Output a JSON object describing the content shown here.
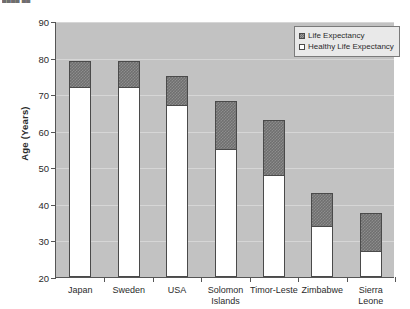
{
  "caption_sliver": "████ ██",
  "chart_data": {
    "type": "bar",
    "subtype": "stacked-overlay",
    "title": "",
    "xlabel": "",
    "ylabel": "Age (Years)",
    "ylim": [
      20,
      90
    ],
    "ytick_step": 10,
    "yticks": [
      20,
      30,
      40,
      50,
      60,
      70,
      80,
      90
    ],
    "ytick_labels": [
      "20",
      "30",
      "40",
      "50",
      "60",
      "70",
      "80",
      "90"
    ],
    "grid": true,
    "grid_axis": "y",
    "legend_position": "top-right",
    "plot_background": "#c2c2c2",
    "categories": [
      "Japan",
      "Sweden",
      "USA",
      "Solomon\nIslands",
      "Timor-Leste",
      "Zimbabwe",
      "Sierra Leone"
    ],
    "series": [
      {
        "name": "Life Expectancy",
        "color": "#6f6f6f",
        "pattern": "checkered",
        "values": [
          79,
          79,
          75,
          68,
          63,
          43,
          37.5
        ]
      },
      {
        "name": "Healthy Life Expectancy",
        "color": "#ffffff",
        "pattern": "solid",
        "values": [
          72,
          72,
          67,
          55,
          48,
          34,
          27
        ]
      }
    ]
  },
  "legend": {
    "items": [
      {
        "label": "Life Expectancy",
        "swatch": "total"
      },
      {
        "label": "Healthy Life Expectancy",
        "swatch": "healthy"
      }
    ]
  }
}
